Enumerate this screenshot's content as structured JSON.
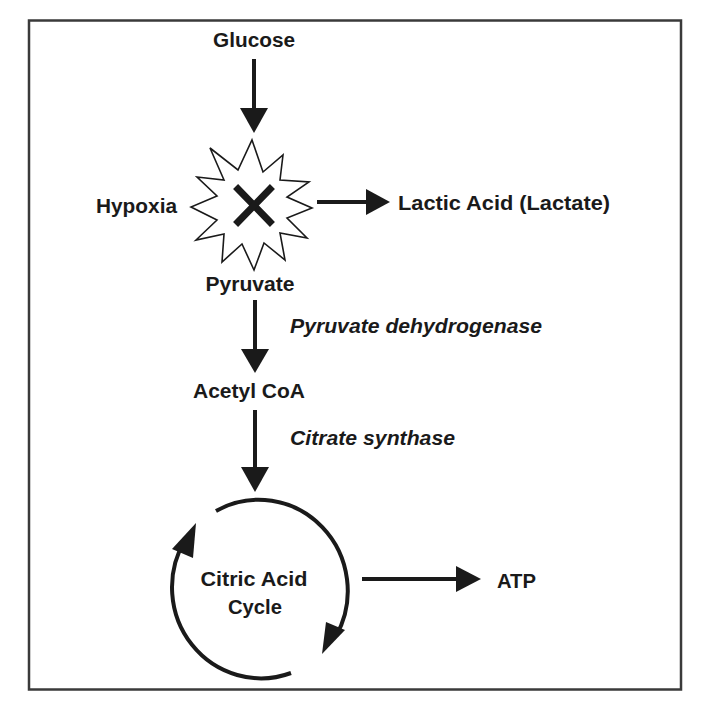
{
  "diagram": {
    "nodes": {
      "glucose": "Glucose",
      "hypoxia": "Hypoxia",
      "lactic_acid": "Lactic Acid (Lactate)",
      "pyruvate": "Pyruvate",
      "acetyl_coa": "Acetyl CoA",
      "citric_acid_cycle_line1": "Citric Acid",
      "citric_acid_cycle_line2": "Cycle",
      "atp": "ATP"
    },
    "enzymes": {
      "pyruvate_dehydrogenase": "Pyruvate dehydrogenase",
      "citrate_synthase": "Citrate synthase"
    },
    "edges": [
      {
        "from": "Glucose",
        "to": "Pyruvate",
        "blocked_by": "Hypoxia"
      },
      {
        "from": "Pyruvate (blocked)",
        "to": "Lactic Acid (Lactate)"
      },
      {
        "from": "Pyruvate",
        "to": "Acetyl CoA",
        "enzyme": "Pyruvate dehydrogenase"
      },
      {
        "from": "Acetyl CoA",
        "to": "Citric Acid Cycle",
        "enzyme": "Citrate synthase"
      },
      {
        "from": "Citric Acid Cycle",
        "to": "ATP"
      }
    ],
    "symbols": {
      "block_marker": "x-mark-in-starburst",
      "cycle": "circular-arrows"
    },
    "colors": {
      "ink": "#1a1a1a",
      "border": "#3a3a3a",
      "background": "#ffffff"
    }
  }
}
